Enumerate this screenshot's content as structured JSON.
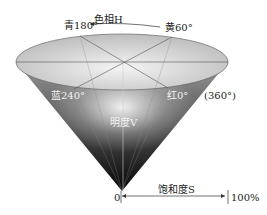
{
  "diagram": {
    "hue_axis": {
      "label": "色相H"
    },
    "hue_points": [
      {
        "name": "cyan",
        "label": "青180°"
      },
      {
        "name": "yellow",
        "label": "黄60°"
      },
      {
        "name": "blue",
        "label": "蓝240°"
      },
      {
        "name": "red",
        "label": "红0°"
      },
      {
        "name": "red-alt",
        "label": "(360°)"
      }
    ],
    "value_axis": {
      "label": "明度V"
    },
    "saturation_axis": {
      "label": "饱和度S",
      "start": "0",
      "end": "100%"
    },
    "colors": {
      "cone_dark": "#000000",
      "cone_light": "#f5f5f5",
      "top_ellipse": "#d9d9d9",
      "edge": "#555555"
    }
  }
}
